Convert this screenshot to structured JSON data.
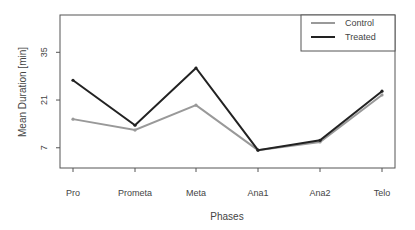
{
  "chart_data": {
    "type": "line",
    "title": "",
    "xlabel": "Phases",
    "ylabel": "Mean Duration [min]",
    "categories": [
      "Pro",
      "Prometa",
      "Meta",
      "Ana1",
      "Ana2",
      "Telo"
    ],
    "yticks": [
      7,
      21,
      35
    ],
    "ylim": [
      0,
      47
    ],
    "grid": false,
    "legend_position": "top-right",
    "series": [
      {
        "name": "Control",
        "color": "#999999",
        "values": [
          15.4,
          12.2,
          19.5,
          6.3,
          8.7,
          22.5
        ]
      },
      {
        "name": "Treated",
        "color": "#222222",
        "values": [
          26.8,
          13.6,
          30.4,
          6.3,
          9.2,
          23.6
        ]
      }
    ]
  },
  "legend": {
    "items": [
      "Control",
      "Treated"
    ]
  }
}
